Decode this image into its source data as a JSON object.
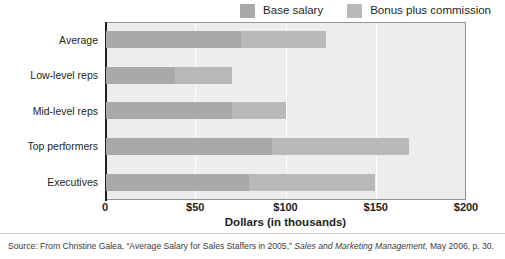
{
  "legend": {
    "position": "top-right",
    "entries": [
      {
        "label": "Base salary",
        "color": "#a9a9a9",
        "swatch_name": "legend-swatch-base-salary"
      },
      {
        "label": "Bonus plus commission",
        "color": "#b9b9b9",
        "swatch_name": "legend-swatch-bonus-plus-commission"
      }
    ]
  },
  "axis": {
    "ticks": [
      "0",
      "$50",
      "$100",
      "$150",
      "$200"
    ],
    "tick_values": [
      0,
      50,
      100,
      150,
      200
    ],
    "title": "Dollars (in thousands)"
  },
  "source": {
    "prefix": "Source: From Christine Galea, “Average Salary for Sales Staffers in 2005,” ",
    "italic": "Sales and Marketing Management",
    "suffix": ", May 2006, p. 30."
  },
  "colors": {
    "base_salary": "#a9a9a9",
    "bonus_plus_commission": "#b9b9b9",
    "plot_background": "#ededed",
    "gridline": "#ffffff",
    "axis": "#231f20",
    "frame": "#939393",
    "page_background": "#ffffff"
  },
  "chart_data": {
    "type": "bar",
    "orientation": "horizontal",
    "stacked": true,
    "title": "",
    "subtitle": "",
    "xlabel": "Dollars (in thousands)",
    "ylabel": "",
    "xlim": [
      0,
      200
    ],
    "xticks": [
      0,
      50,
      100,
      150,
      200
    ],
    "xticklabels": [
      "0",
      "$50",
      "$100",
      "$150",
      "$200"
    ],
    "grid": "vertical",
    "legend_position": "top-right",
    "categories": [
      "Average",
      "Low-level reps",
      "Mid-level reps",
      "Top performers",
      "Executives"
    ],
    "series": [
      {
        "name": "Base salary",
        "color": "#a9a9a9",
        "values": [
          75,
          38,
          70,
          92,
          79
        ]
      },
      {
        "name": "Bonus plus commission",
        "color": "#b9b9b9",
        "values": [
          47,
          32,
          30,
          76,
          70
        ]
      }
    ],
    "totals": [
      122,
      70,
      100,
      168,
      149
    ],
    "units": "thousands of dollars",
    "annotations": []
  }
}
